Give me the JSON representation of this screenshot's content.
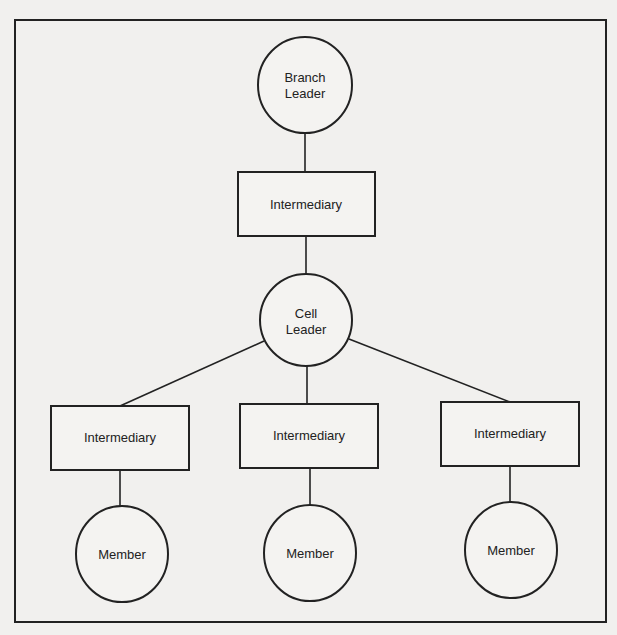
{
  "diagram": {
    "type": "hierarchy",
    "nodes": [
      {
        "id": "branch-leader",
        "shape": "circle",
        "lines": [
          "Branch",
          "Leader"
        ]
      },
      {
        "id": "top-intermediary",
        "shape": "rect",
        "lines": [
          "Intermediary"
        ]
      },
      {
        "id": "cell-leader",
        "shape": "circle",
        "lines": [
          "Cell",
          "Leader"
        ]
      },
      {
        "id": "left-intermediary",
        "shape": "rect",
        "lines": [
          "Intermediary"
        ]
      },
      {
        "id": "middle-intermediary",
        "shape": "rect",
        "lines": [
          "Intermediary"
        ]
      },
      {
        "id": "right-intermediary",
        "shape": "rect",
        "lines": [
          "Intermediary"
        ]
      },
      {
        "id": "left-member",
        "shape": "circle",
        "lines": [
          "Member"
        ]
      },
      {
        "id": "middle-member",
        "shape": "circle",
        "lines": [
          "Member"
        ]
      },
      {
        "id": "right-member",
        "shape": "circle",
        "lines": [
          "Member"
        ]
      }
    ],
    "edges": [
      [
        "branch-leader",
        "top-intermediary"
      ],
      [
        "top-intermediary",
        "cell-leader"
      ],
      [
        "cell-leader",
        "left-intermediary"
      ],
      [
        "cell-leader",
        "middle-intermediary"
      ],
      [
        "cell-leader",
        "right-intermediary"
      ],
      [
        "left-intermediary",
        "left-member"
      ],
      [
        "middle-intermediary",
        "middle-member"
      ],
      [
        "right-intermediary",
        "right-member"
      ]
    ],
    "colors": {
      "stroke": "#222222",
      "background": "#f1f0ee"
    }
  }
}
